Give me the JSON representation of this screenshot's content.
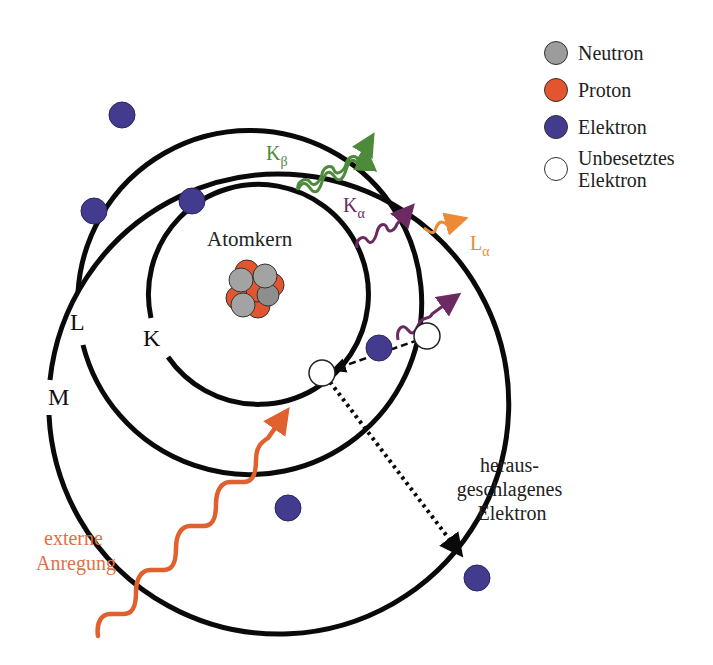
{
  "colors": {
    "neutron": "#9c9c9c",
    "proton": "#e2552e",
    "electron": "#433c8e",
    "vacancy": "#ffffff",
    "shell": "#0a0a0a",
    "k_beta": "#4d8a3a",
    "k_alpha": "#6b2a62",
    "l_alpha": "#ee8a35",
    "excitation": "#e0602e",
    "excitation_text": "#e07046"
  },
  "legend": {
    "items": [
      {
        "label": "Neutron",
        "color": "#9c9c9c"
      },
      {
        "label": "Proton",
        "color": "#e2552e"
      },
      {
        "label": "Elektron",
        "color": "#433c8e"
      },
      {
        "label": "Unbesetztes\nElektron",
        "color": "#ffffff"
      }
    ]
  },
  "labels": {
    "nucleus": "Atomkern",
    "shell_k": "K",
    "shell_l": "L",
    "shell_m": "M",
    "k_beta_main": "K",
    "k_beta_sub": "β",
    "k_alpha_main": "K",
    "k_alpha_sub": "α",
    "l_alpha_main": "L",
    "l_alpha_sub": "α",
    "excitation_line1": "externe",
    "excitation_line2": "Anregung",
    "ejected_line1": "heraus-",
    "ejected_line2": "geschlagenes",
    "ejected_line3": "Elektron"
  }
}
